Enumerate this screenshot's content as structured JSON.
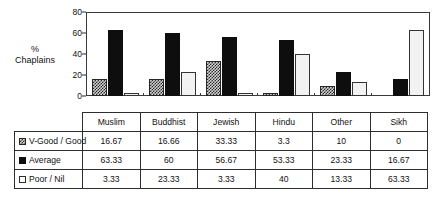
{
  "chart_data": {
    "type": "bar",
    "title": "",
    "xlabel": "",
    "ylabel": "% Chaplains",
    "ylabel_lines": [
      "%",
      "Chaplains"
    ],
    "ylim": [
      0,
      80
    ],
    "yticks": [
      0,
      20,
      40,
      60,
      80
    ],
    "grid": false,
    "legend_position": "table-below",
    "categories": [
      "Muslim",
      "Buddhist",
      "Jewish",
      "Hindu",
      "Other",
      "Sikh"
    ],
    "series": [
      {
        "name": "V-Good / Good",
        "swatch": "checkered-pattern-swatch",
        "values": [
          16.67,
          16.66,
          33.33,
          3.3,
          10,
          0
        ],
        "labels": [
          "16.67",
          "16.66",
          "33.33",
          "3.3",
          "10",
          "0"
        ]
      },
      {
        "name": "Average",
        "swatch": "solid-black-swatch",
        "values": [
          63.33,
          60,
          56.67,
          53.33,
          23.33,
          16.67
        ],
        "labels": [
          "63.33",
          "60",
          "56.67",
          "53.33",
          "23.33",
          "16.67"
        ]
      },
      {
        "name": "Poor / Nil",
        "swatch": "white-outline-swatch",
        "values": [
          3.33,
          23.33,
          3.33,
          40,
          13.33,
          63.33
        ],
        "labels": [
          "3.33",
          "23.33",
          "3.33",
          "40",
          "13.33",
          "63.33"
        ]
      }
    ]
  }
}
